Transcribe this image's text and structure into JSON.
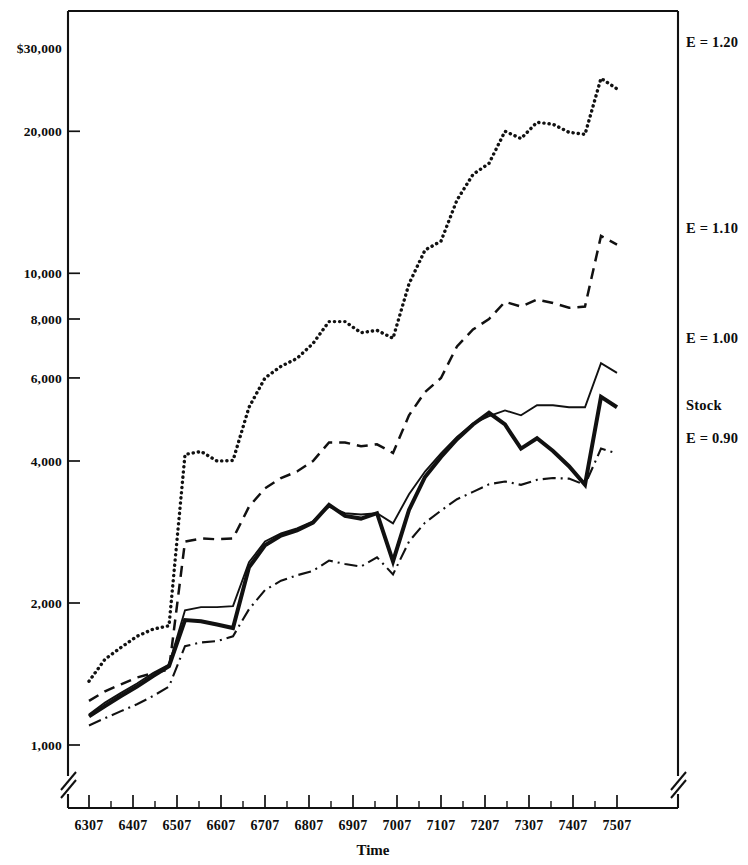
{
  "chart_data": {
    "type": "line",
    "title": "",
    "xlabel": "Time",
    "ylabel": "",
    "yscale": "log",
    "ylim": [
      1000,
      30000
    ],
    "ytick_labels": [
      "$30,000",
      "20,000",
      "10,000",
      "8,000",
      "6,000",
      "4,000",
      "2,000",
      "1,000"
    ],
    "ytick_values": [
      30000,
      20000,
      10000,
      8000,
      6000,
      4000,
      2000,
      1000
    ],
    "xtick_labels": [
      "6307",
      "6407",
      "6507",
      "6607",
      "6707",
      "6807",
      "6907",
      "7007",
      "7107",
      "7207",
      "7307",
      "7407",
      "7507"
    ],
    "x_axis_break": true,
    "y_axis_break": true,
    "grid": false,
    "legend_position": "right-of-plot",
    "series": [
      {
        "name": "E = 1.20",
        "label": "E = 1.20",
        "style": "dotted",
        "values": [
          1365,
          1520,
          1610,
          1700,
          1760,
          1790,
          4130,
          4190,
          4000,
          4010,
          5200,
          6000,
          6350,
          6600,
          7100,
          7900,
          7900,
          7480,
          7570,
          7280,
          9500,
          11200,
          11700,
          14300,
          16200,
          17100,
          20000,
          19300,
          20900,
          20700,
          19900,
          19700,
          25900,
          24600
        ]
      },
      {
        "name": "E = 1.10",
        "label": "E = 1.10",
        "style": "dashed",
        "values": [
          1240,
          1300,
          1345,
          1390,
          1420,
          1445,
          2700,
          2740,
          2730,
          2740,
          3200,
          3500,
          3680,
          3800,
          4000,
          4380,
          4380,
          4300,
          4340,
          4160,
          5000,
          5600,
          6000,
          7000,
          7600,
          8000,
          8700,
          8500,
          8800,
          8650,
          8450,
          8500,
          12000,
          11500
        ]
      },
      {
        "name": "E = 1.00",
        "label": "E = 1.00",
        "style": "solid-thin",
        "values": [
          1160,
          1230,
          1290,
          1350,
          1420,
          1480,
          1930,
          1960,
          1960,
          1970,
          2440,
          2700,
          2810,
          2880,
          2980,
          3200,
          3100,
          3080,
          3100,
          2950,
          3400,
          3800,
          4150,
          4500,
          4800,
          4980,
          5120,
          5000,
          5250,
          5250,
          5200,
          5200,
          6450,
          6150
        ]
      },
      {
        "name": "Stock",
        "label": "Stock",
        "style": "solid-thick",
        "values": [
          1150,
          1210,
          1270,
          1330,
          1400,
          1470,
          1840,
          1830,
          1800,
          1770,
          2380,
          2650,
          2780,
          2850,
          2960,
          3230,
          3060,
          3020,
          3100,
          2450,
          3150,
          3700,
          4080,
          4450,
          4780,
          5060,
          4780,
          4250,
          4470,
          4200,
          3900,
          3560,
          5470,
          5200
        ]
      },
      {
        "name": "E = 0.90",
        "label": "E = 0.90",
        "style": "dash-dot",
        "values": [
          1100,
          1140,
          1180,
          1220,
          1270,
          1330,
          1620,
          1650,
          1660,
          1700,
          1940,
          2130,
          2230,
          2290,
          2340,
          2460,
          2420,
          2390,
          2500,
          2300,
          2700,
          2960,
          3140,
          3320,
          3440,
          3570,
          3620,
          3560,
          3650,
          3680,
          3670,
          3560,
          4250,
          4150
        ]
      }
    ]
  },
  "axes": {
    "x_title": "Time"
  }
}
